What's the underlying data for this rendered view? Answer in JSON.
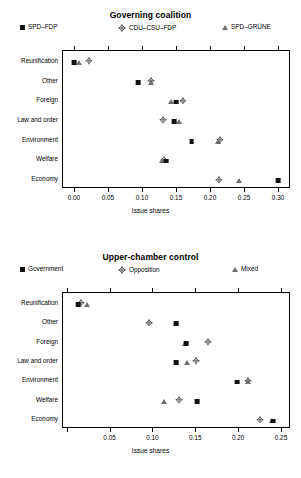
{
  "figure": {
    "width": 301,
    "height": 478,
    "background": "#ffffff"
  },
  "colors": {
    "square": "#111111",
    "triangle": "#6e6e6e",
    "diamond_outline": "#333333",
    "axis": "#000000"
  },
  "panels": [
    {
      "id": "governing-coalition",
      "title": "Governing coalition",
      "legend": [
        {
          "label": "SPD–FDP",
          "marker": "square"
        },
        {
          "label": "CDU–CSU–FDP",
          "marker": "diamond"
        },
        {
          "label": "SPD–GRÜNE",
          "marker": "triangle"
        }
      ],
      "xlabel": "Issue shares",
      "xticks": [
        0.0,
        0.05,
        0.1,
        0.15,
        0.2,
        0.25,
        0.3
      ],
      "xticklabels": [
        "0.00",
        "0.05",
        "0.10",
        "0.15",
        "0.20",
        "0.25",
        "0.30"
      ],
      "xlim": [
        -0.0175,
        0.3175
      ],
      "categories": [
        "Reunification",
        "Other",
        "Foreign",
        "Law and order",
        "Environment",
        "Welfare",
        "Economy"
      ]
    },
    {
      "id": "upper-chamber-control",
      "title": "Upper-chamber control",
      "legend": [
        {
          "label": "Government",
          "marker": "square"
        },
        {
          "label": "Opposition",
          "marker": "diamond"
        },
        {
          "label": "Mixed",
          "marker": "triangle"
        }
      ],
      "xlabel": "Issue shares",
      "xticks": [
        0.0,
        0.05,
        0.1,
        0.15,
        0.2,
        0.25
      ],
      "xticklabels": [
        "",
        "0.05",
        "0.10",
        "0.15",
        "0.20",
        "0.25"
      ],
      "xlim": [
        -0.0055,
        0.2605
      ],
      "categories": [
        "Reunification",
        "Other",
        "Foreign",
        "Law and order",
        "Environment",
        "Welfare",
        "Economy"
      ]
    }
  ],
  "chart_data": [
    {
      "type": "scatter",
      "title": "Governing coalition",
      "xlabel": "Issue shares",
      "ylabel": "",
      "xlim": [
        -0.0175,
        0.3175
      ],
      "grid": false,
      "legend_position": "top",
      "categories": [
        "Reunification",
        "Other",
        "Foreign",
        "Law and order",
        "Environment",
        "Welfare",
        "Economy"
      ],
      "series": [
        {
          "name": "SPD-FDP",
          "marker": "square",
          "color": "#111111",
          "values": [
            0.0,
            0.094,
            0.15,
            0.147,
            0.173,
            0.136,
            0.3
          ]
        },
        {
          "name": "CDU-CSU-FDP",
          "marker": "diamond",
          "color": "#333333",
          "values": [
            0.022,
            0.114,
            0.16,
            0.131,
            0.214,
            0.133,
            0.213
          ]
        },
        {
          "name": "SPD-GRUENE",
          "marker": "triangle",
          "color": "#6e6e6e",
          "values": [
            0.008,
            0.113,
            0.142,
            0.154,
            0.211,
            0.13,
            0.242
          ]
        }
      ]
    },
    {
      "type": "scatter",
      "title": "Upper-chamber control",
      "xlabel": "Issue shares",
      "ylabel": "",
      "xlim": [
        -0.0055,
        0.2605
      ],
      "grid": false,
      "legend_position": "top",
      "categories": [
        "Reunification",
        "Other",
        "Foreign",
        "Law and order",
        "Environment",
        "Welfare",
        "Economy"
      ],
      "series": [
        {
          "name": "Government",
          "marker": "square",
          "color": "#111111",
          "values": [
            0.013,
            0.128,
            0.139,
            0.128,
            0.199,
            0.152,
            0.241
          ]
        },
        {
          "name": "Opposition",
          "marker": "diamond",
          "color": "#333333",
          "values": [
            0.017,
            0.096,
            0.165,
            0.151,
            0.212,
            0.131,
            0.226
          ]
        },
        {
          "name": "Mixed",
          "marker": "triangle",
          "color": "#6e6e6e",
          "values": [
            0.024,
            0.127,
            0.138,
            0.14,
            0.211,
            0.113,
            0.24
          ]
        }
      ]
    }
  ]
}
